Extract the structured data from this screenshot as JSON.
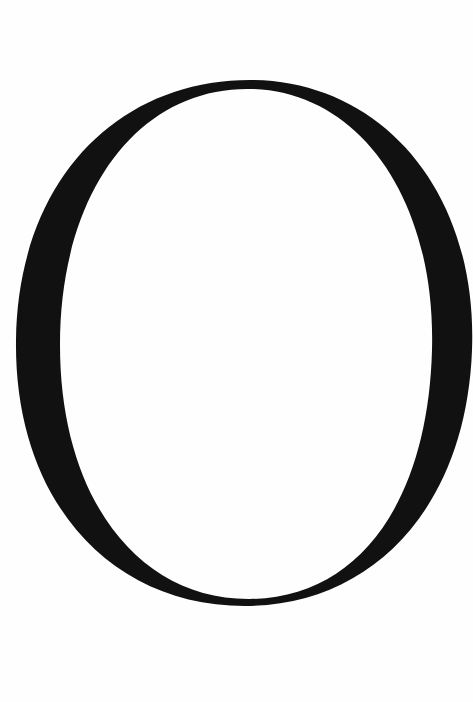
{
  "image": {
    "description": "Large serif capital letter",
    "glyph": "O",
    "ink_color": "#111111",
    "background_color": "#fefefe"
  }
}
